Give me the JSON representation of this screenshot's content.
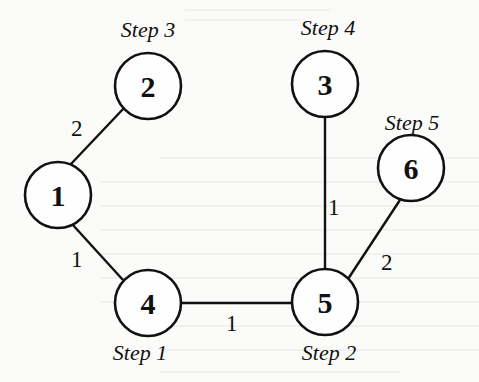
{
  "diagram": {
    "type": "graph",
    "nodes": [
      {
        "id": "1",
        "label": "1",
        "x": 58,
        "y": 195,
        "step": ""
      },
      {
        "id": "2",
        "label": "2",
        "x": 148,
        "y": 86,
        "step": "Step 3"
      },
      {
        "id": "3",
        "label": "3",
        "x": 325,
        "y": 84,
        "step": "Step 4"
      },
      {
        "id": "4",
        "label": "4",
        "x": 148,
        "y": 303,
        "step": "Step 1"
      },
      {
        "id": "5",
        "label": "5",
        "x": 325,
        "y": 302,
        "step": "Step 2"
      },
      {
        "id": "6",
        "label": "6",
        "x": 411,
        "y": 168,
        "step": "Step 5"
      }
    ],
    "edges": [
      {
        "from": "1",
        "to": "2",
        "weight": "2"
      },
      {
        "from": "1",
        "to": "4",
        "weight": "1"
      },
      {
        "from": "4",
        "to": "5",
        "weight": "1"
      },
      {
        "from": "3",
        "to": "5",
        "weight": "1"
      },
      {
        "from": "5",
        "to": "6",
        "weight": "2"
      }
    ],
    "step_labels": {
      "node2": "Step 3",
      "node3": "Step 4",
      "node4": "Step 1",
      "node5": "Step 2",
      "node6": "Step 5"
    }
  }
}
